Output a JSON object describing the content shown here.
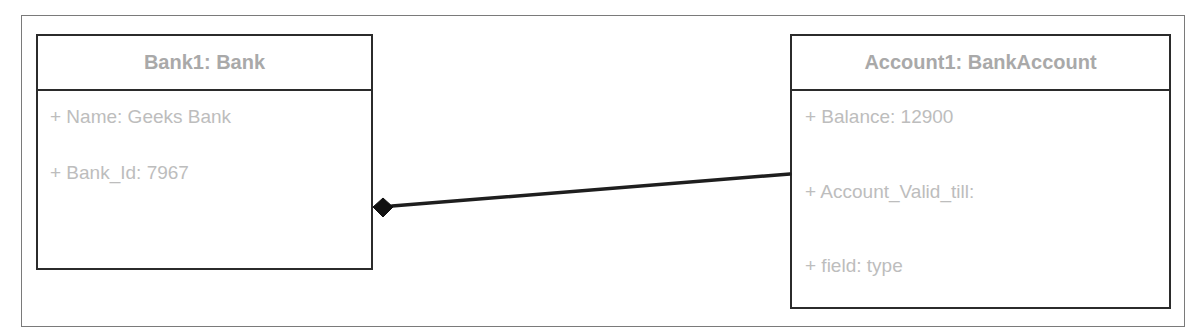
{
  "diagram": {
    "type": "UML object diagram",
    "objects": [
      {
        "id": "bank1",
        "title": "Bank1: Bank",
        "attributes": [
          "+ Name: Geeks Bank",
          "+ Bank_Id: 7967"
        ]
      },
      {
        "id": "account1",
        "title": "Account1: BankAccount",
        "attributes": [
          "+ Balance: 12900",
          "+ Account_Valid_till:",
          "+ field: type"
        ]
      }
    ],
    "relationships": [
      {
        "type": "composition",
        "from": "Account1: BankAccount",
        "to": "Bank1: Bank",
        "diamond_end": "Bank1: Bank"
      }
    ],
    "colors": {
      "border": "#2b2b2b",
      "frame": "#7a7a7a",
      "title_text": "#a9a9a9",
      "attribute_text": "#bdbdbd",
      "connector": "#1e1e1e"
    }
  }
}
